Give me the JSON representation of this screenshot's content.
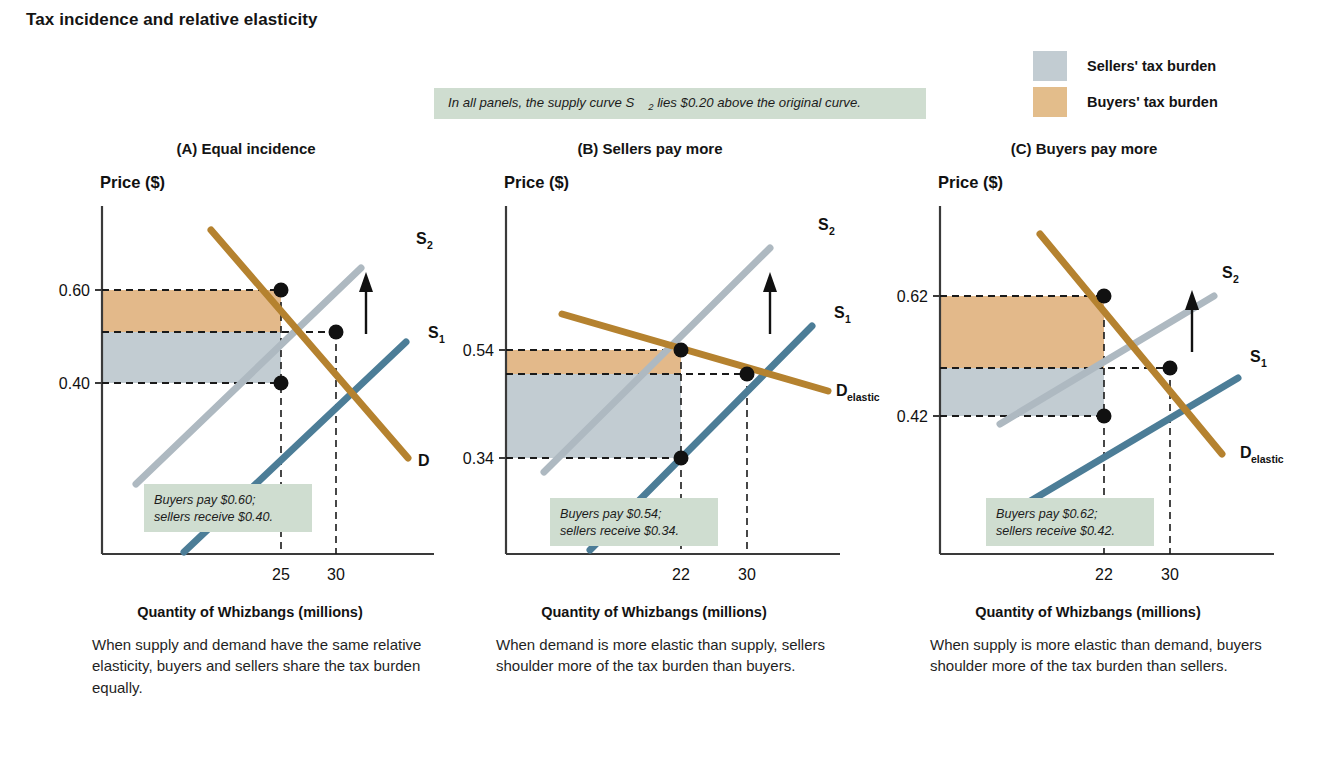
{
  "figure": {
    "title": "Tax incidence and relative elasticity",
    "note": "In all panels, the supply curve S2 lies $0.20 above the original curve.",
    "note_parts": {
      "before": "In all panels, the supply curve S",
      "sub": "2",
      "after": " lies $0.20 above the original curve."
    }
  },
  "legend": {
    "items": [
      {
        "label": "Sellers' tax burden",
        "color": "#c2ccd2",
        "name": "sellers-tax-burden"
      },
      {
        "label": "Buyers' tax burden",
        "color": "#e3bd8b",
        "name": "buyers-tax-burden"
      }
    ]
  },
  "colors": {
    "demand": "#b5822f",
    "supply1": "#4c7d97",
    "supply2": "#aeb9c1",
    "sellers_fill": "#c2ccd2",
    "buyers_fill": "#e3b98a",
    "callout_bg": "#cfddd0",
    "axis": "#3a3a3a",
    "dashed": "#1a1a1a"
  },
  "panels": [
    {
      "id": "A",
      "title": "(A) Equal incidence",
      "ylabel": "Price ($)",
      "xlabel": "Quantity of Whizbangs (millions)",
      "caption": "When supply and demand have the same relative elasticity, buyers and sellers share the tax burden equally.",
      "callout": {
        "line1": "Buyers pay $0.60;",
        "line2": "sellers receive $0.40."
      },
      "yticks": [
        {
          "value": 0.6,
          "label": "0.60"
        },
        {
          "value": 0.4,
          "label": "0.40"
        }
      ],
      "xticks": [
        {
          "value": 25,
          "label": "25"
        },
        {
          "value": 30,
          "label": "30"
        }
      ],
      "prices": {
        "buyers_pay": 0.6,
        "original": 0.5,
        "sellers_receive": 0.4
      },
      "quantities": {
        "after_tax": 25,
        "before_tax": 30
      },
      "curve_labels": [
        {
          "text": "S",
          "sub": "2",
          "name": "supply2-label"
        },
        {
          "text": "S",
          "sub": "1",
          "name": "supply1-label"
        },
        {
          "text": "D",
          "sub": "",
          "name": "demand-label"
        }
      ],
      "points": [
        {
          "q": 25,
          "p": 0.6,
          "name": "new-equilibrium-point"
        },
        {
          "q": 30,
          "p": 0.5,
          "name": "original-equilibrium-point"
        },
        {
          "q": 25,
          "p": 0.4,
          "name": "sellers-price-point"
        }
      ],
      "curves": {
        "demand": {
          "x1": 175,
          "y1": 64,
          "x2": 372,
          "y2": 292
        },
        "supply1": {
          "x1": 148,
          "y1": 386,
          "x2": 370,
          "y2": 176
        },
        "supply2": {
          "x1": 100,
          "y1": 318,
          "x2": 325,
          "y2": 102
        }
      },
      "plot": {
        "x0": 66,
        "y0": 40,
        "x1": 398,
        "y1": 388
      },
      "scale": {
        "px_060": 124,
        "px_050": 166,
        "px_040": 217,
        "px_q25": 245,
        "px_q30": 300
      }
    },
    {
      "id": "B",
      "title": "(B) Sellers pay more",
      "ylabel": "Price ($)",
      "xlabel": "Quantity of Whizbangs (millions)",
      "caption": "When demand is more elastic than supply, sellers shoulder more of the tax burden than buyers.",
      "callout": {
        "line1": "Buyers pay $0.54;",
        "line2": "sellers receive $0.34."
      },
      "yticks": [
        {
          "value": 0.54,
          "label": "0.54"
        },
        {
          "value": 0.34,
          "label": "0.34"
        }
      ],
      "xticks": [
        {
          "value": 22,
          "label": "22"
        },
        {
          "value": 30,
          "label": "30"
        }
      ],
      "prices": {
        "buyers_pay": 0.54,
        "original": 0.5,
        "sellers_receive": 0.34
      },
      "quantities": {
        "after_tax": 22,
        "before_tax": 30
      },
      "curve_labels": [
        {
          "text": "S",
          "sub": "2",
          "name": "supply2-label"
        },
        {
          "text": "S",
          "sub": "1",
          "name": "supply1-label"
        },
        {
          "text": "D",
          "sub": "elastic",
          "name": "demand-elastic-label"
        }
      ],
      "points": [
        {
          "q": 22,
          "p": 0.54,
          "name": "new-equilibrium-point"
        },
        {
          "q": 30,
          "p": 0.5,
          "name": "original-equilibrium-point"
        },
        {
          "q": 22,
          "p": 0.34,
          "name": "sellers-price-point"
        }
      ],
      "curves": {
        "demand": {
          "x1": 122,
          "y1": 148,
          "x2": 388,
          "y2": 225
        },
        "supply1": {
          "x1": 150,
          "y1": 384,
          "x2": 372,
          "y2": 160
        },
        "supply2": {
          "x1": 104,
          "y1": 306,
          "x2": 330,
          "y2": 82
        }
      },
      "plot": {
        "x0": 66,
        "y0": 40,
        "x1": 400,
        "y1": 388
      },
      "scale": {
        "px_054": 184,
        "px_050": 208,
        "px_034": 292,
        "px_q22": 241,
        "px_q30": 307
      }
    },
    {
      "id": "C",
      "title": "(C) Buyers pay more",
      "ylabel": "Price ($)",
      "xlabel": "Quantity of Whizbangs (millions)",
      "caption": "When supply is more elastic than demand, buyers shoulder more of the tax burden than sellers.",
      "callout": {
        "line1": "Buyers pay $0.62;",
        "line2": "sellers receive $0.42."
      },
      "yticks": [
        {
          "value": 0.62,
          "label": "0.62"
        },
        {
          "value": 0.42,
          "label": "0.42"
        }
      ],
      "xticks": [
        {
          "value": 22,
          "label": "22"
        },
        {
          "value": 30,
          "label": "30"
        }
      ],
      "prices": {
        "buyers_pay": 0.62,
        "original": 0.5,
        "sellers_receive": 0.42
      },
      "quantities": {
        "after_tax": 22,
        "before_tax": 30
      },
      "curve_labels": [
        {
          "text": "S",
          "sub": "2",
          "name": "supply2-label"
        },
        {
          "text": "S",
          "sub": "1",
          "name": "supply1-label"
        },
        {
          "text": "D",
          "sub": "elastic",
          "name": "demand-elastic-label"
        }
      ],
      "points": [
        {
          "q": 22,
          "p": 0.62,
          "name": "new-equilibrium-point"
        },
        {
          "q": 30,
          "p": 0.5,
          "name": "original-equilibrium-point"
        },
        {
          "q": 22,
          "p": 0.42,
          "name": "sellers-price-point"
        }
      ],
      "curves": {
        "demand": {
          "x1": 166,
          "y1": 68,
          "x2": 348,
          "y2": 288
        },
        "supply1": {
          "x1": 148,
          "y1": 340,
          "x2": 364,
          "y2": 212
        },
        "supply2": {
          "x1": 126,
          "y1": 258,
          "x2": 340,
          "y2": 130
        }
      },
      "plot": {
        "x0": 66,
        "y0": 40,
        "x1": 400,
        "y1": 388
      },
      "scale": {
        "px_062": 130,
        "px_050": 202,
        "px_042": 250,
        "px_q22": 230,
        "px_q30": 296
      }
    }
  ],
  "chart_data": {
    "type": "line",
    "title": "Tax incidence and relative elasticity",
    "xlabel": "Quantity of Whizbangs (millions)",
    "ylabel": "Price ($)",
    "tax_per_unit": 0.2,
    "panels": [
      {
        "panel": "A",
        "title": "(A) Equal incidence",
        "relative_elasticity": "supply and demand equally elastic",
        "pre_tax_equilibrium": {
          "quantity": 30,
          "price": 0.5
        },
        "post_tax": {
          "quantity": 25,
          "price_buyers_pay": 0.6,
          "price_sellers_receive": 0.4
        },
        "buyers_burden": 0.1,
        "sellers_burden": 0.1,
        "series": [
          {
            "name": "D",
            "type": "demand",
            "slope": "downward",
            "color": "#b5822f"
          },
          {
            "name": "S1",
            "type": "supply",
            "slope": "upward",
            "color": "#4c7d97"
          },
          {
            "name": "S2",
            "type": "supply-after-tax",
            "slope": "upward",
            "color": "#aeb9c1"
          }
        ]
      },
      {
        "panel": "B",
        "title": "(B) Sellers pay more",
        "relative_elasticity": "demand more elastic than supply",
        "pre_tax_equilibrium": {
          "quantity": 30,
          "price": 0.5
        },
        "post_tax": {
          "quantity": 22,
          "price_buyers_pay": 0.54,
          "price_sellers_receive": 0.34
        },
        "buyers_burden": 0.04,
        "sellers_burden": 0.16,
        "series": [
          {
            "name": "Delastic",
            "type": "demand",
            "slope": "shallow downward",
            "color": "#b5822f"
          },
          {
            "name": "S1",
            "type": "supply",
            "slope": "steep upward",
            "color": "#4c7d97"
          },
          {
            "name": "S2",
            "type": "supply-after-tax",
            "slope": "steep upward",
            "color": "#aeb9c1"
          }
        ]
      },
      {
        "panel": "C",
        "title": "(C) Buyers pay more",
        "relative_elasticity": "supply more elastic than demand",
        "pre_tax_equilibrium": {
          "quantity": 30,
          "price": 0.5
        },
        "post_tax": {
          "quantity": 22,
          "price_buyers_pay": 0.62,
          "price_sellers_receive": 0.42
        },
        "buyers_burden": 0.12,
        "sellers_burden": 0.08,
        "series": [
          {
            "name": "Delastic",
            "type": "demand",
            "slope": "steep downward",
            "color": "#b5822f"
          },
          {
            "name": "S1",
            "type": "supply",
            "slope": "shallow upward",
            "color": "#4c7d97"
          },
          {
            "name": "S2",
            "type": "supply-after-tax",
            "slope": "shallow upward",
            "color": "#aeb9c1"
          }
        ]
      }
    ],
    "legend": [
      "Sellers' tax burden",
      "Buyers' tax burden"
    ],
    "legend_position": "top-right",
    "grid": false
  }
}
